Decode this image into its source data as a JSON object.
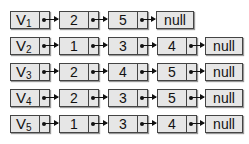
{
  "diagram": {
    "type": "adjacency-list",
    "lists": [
      {
        "head": "V",
        "subscript": "1",
        "nodes": [
          "2",
          "5"
        ],
        "terminator": "null"
      },
      {
        "head": "V",
        "subscript": "2",
        "nodes": [
          "1",
          "3",
          "4"
        ],
        "terminator": "null"
      },
      {
        "head": "V",
        "subscript": "3",
        "nodes": [
          "2",
          "4",
          "5"
        ],
        "terminator": "null"
      },
      {
        "head": "V",
        "subscript": "4",
        "nodes": [
          "2",
          "3",
          "5"
        ],
        "terminator": "null"
      },
      {
        "head": "V",
        "subscript": "5",
        "nodes": [
          "1",
          "3",
          "4"
        ],
        "terminator": "null"
      }
    ]
  }
}
